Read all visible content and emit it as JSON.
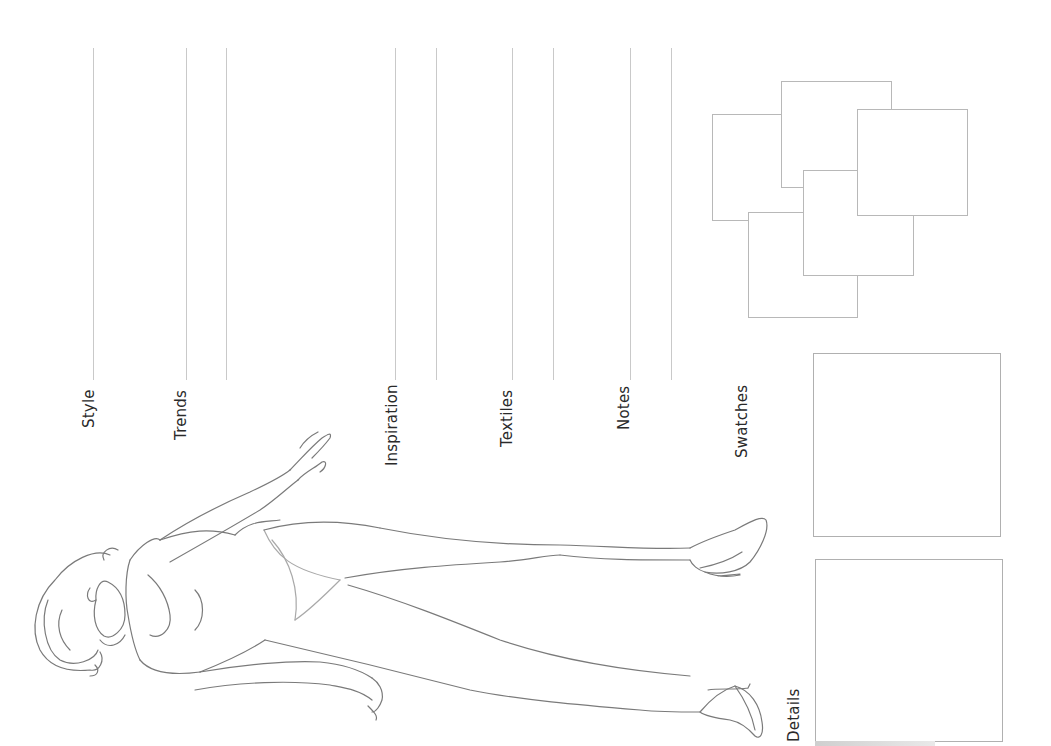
{
  "sheet": {
    "labels": {
      "style": "Style",
      "trends": "Trends",
      "inspiration": "Inspiration",
      "textiles": "Textiles",
      "notes": "Notes",
      "swatches": "Swatches",
      "details": "Details"
    },
    "line_color": "#c9c9c9",
    "text_color": "#2a2a2a"
  },
  "icons": {
    "figure": "fashion-croquis-figure"
  }
}
